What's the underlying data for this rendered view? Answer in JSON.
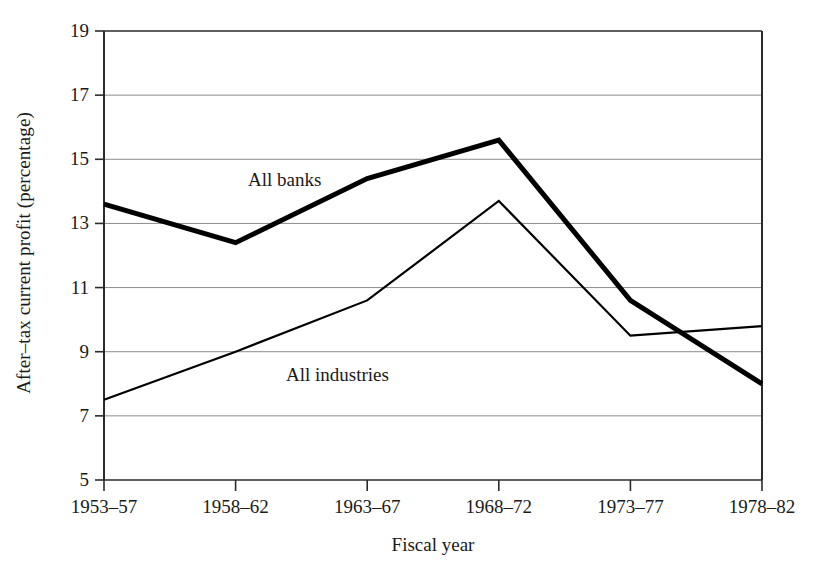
{
  "chart_data": {
    "type": "line",
    "title": "",
    "xlabel": "Fiscal year",
    "ylabel": "After–tax current profit (percentage)",
    "categories": [
      "1953–57",
      "1958–62",
      "1963–67",
      "1968–72",
      "1973–77",
      "1978–82"
    ],
    "ylim": [
      5,
      19
    ],
    "yticks": [
      5,
      7,
      9,
      11,
      13,
      15,
      17,
      19
    ],
    "ytick_labels": [
      "5",
      "7",
      "9",
      "11",
      "13",
      "15",
      "17",
      "19"
    ],
    "grid": "horizontal",
    "legend_position": "inline-annotation",
    "series": [
      {
        "name": "All banks",
        "values": [
          13.6,
          12.4,
          14.4,
          15.6,
          10.6,
          8.0
        ],
        "style": "thick",
        "color": "#000000",
        "line_width": 5
      },
      {
        "name": "All industries",
        "values": [
          7.5,
          9.0,
          10.6,
          13.7,
          9.5,
          9.8
        ],
        "style": "thin",
        "color": "#000000",
        "line_width": 2.2
      }
    ],
    "annotations": [
      {
        "text": "All banks",
        "x_px": 248,
        "y_px": 170
      },
      {
        "text": "All industries",
        "x_px": 286,
        "y_px": 365
      }
    ]
  },
  "axes": {
    "frame_color": "#2b2b2b",
    "grid_color": "#8c8c8c"
  }
}
